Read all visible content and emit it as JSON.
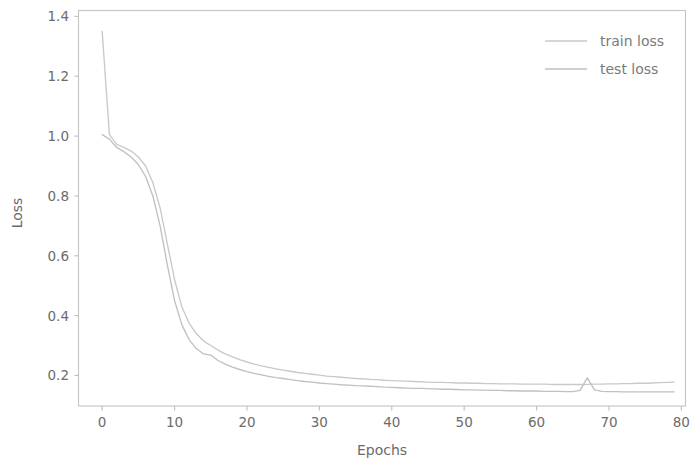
{
  "figure": {
    "background_color": "#ffffff",
    "axes_color": "#c4c4c4",
    "text_color": "#6b6b6b"
  },
  "axes": {
    "xlabel": "Epochs",
    "ylabel": "Loss",
    "x_ticks": [
      "0",
      "10",
      "20",
      "30",
      "40",
      "50",
      "60",
      "70",
      "80"
    ],
    "y_ticks": [
      "0.2",
      "0.4",
      "0.6",
      "0.8",
      "1.0",
      "1.2",
      "1.4"
    ]
  },
  "legend": {
    "items": [
      {
        "label": "train loss",
        "color": "#c9c9c9"
      },
      {
        "label": "test loss",
        "color": "#c0c0c0"
      }
    ]
  },
  "chart_data": {
    "type": "line",
    "title": "",
    "xlabel": "Epochs",
    "ylabel": "Loss",
    "xlim": [
      -3.2,
      80.5
    ],
    "ylim": [
      0.098,
      1.418
    ],
    "x_ticks": [
      0,
      10,
      20,
      30,
      40,
      50,
      60,
      70,
      80
    ],
    "y_ticks": [
      0.2,
      0.4,
      0.6,
      0.8,
      1.0,
      1.2,
      1.4
    ],
    "grid": false,
    "legend_position": "upper right",
    "x": [
      0,
      1,
      2,
      3,
      4,
      5,
      6,
      7,
      8,
      9,
      10,
      11,
      12,
      13,
      14,
      15,
      16,
      17,
      18,
      19,
      20,
      21,
      22,
      23,
      24,
      25,
      26,
      27,
      28,
      29,
      30,
      31,
      32,
      33,
      34,
      35,
      36,
      37,
      38,
      39,
      40,
      41,
      42,
      43,
      44,
      45,
      46,
      47,
      48,
      49,
      50,
      51,
      52,
      53,
      54,
      55,
      56,
      57,
      58,
      59,
      60,
      61,
      62,
      63,
      64,
      65,
      66,
      67,
      68,
      69,
      70,
      71,
      72,
      73,
      74,
      75,
      76,
      77,
      78,
      79
    ],
    "series": [
      {
        "name": "train loss",
        "color": "#c9c9c9",
        "values": [
          1.35,
          1.005,
          0.972,
          0.962,
          0.95,
          0.93,
          0.9,
          0.845,
          0.76,
          0.64,
          0.52,
          0.43,
          0.375,
          0.34,
          0.315,
          0.3,
          0.285,
          0.272,
          0.262,
          0.253,
          0.245,
          0.238,
          0.232,
          0.227,
          0.222,
          0.218,
          0.214,
          0.21,
          0.207,
          0.204,
          0.201,
          0.198,
          0.196,
          0.194,
          0.192,
          0.19,
          0.189,
          0.187,
          0.186,
          0.184,
          0.183,
          0.182,
          0.181,
          0.18,
          0.179,
          0.178,
          0.177,
          0.177,
          0.176,
          0.175,
          0.175,
          0.174,
          0.174,
          0.173,
          0.173,
          0.172,
          0.172,
          0.172,
          0.171,
          0.171,
          0.171,
          0.171,
          0.17,
          0.17,
          0.17,
          0.17,
          0.17,
          0.17,
          0.171,
          0.171,
          0.172,
          0.172,
          0.173,
          0.173,
          0.174,
          0.174,
          0.175,
          0.176,
          0.177,
          0.178
        ]
      },
      {
        "name": "test loss",
        "color": "#c0c0c0",
        "values": [
          1.005,
          0.99,
          0.962,
          0.948,
          0.93,
          0.905,
          0.865,
          0.8,
          0.7,
          0.57,
          0.45,
          0.37,
          0.32,
          0.29,
          0.272,
          0.268,
          0.25,
          0.238,
          0.228,
          0.22,
          0.213,
          0.207,
          0.202,
          0.197,
          0.193,
          0.19,
          0.186,
          0.183,
          0.18,
          0.178,
          0.175,
          0.173,
          0.171,
          0.169,
          0.168,
          0.166,
          0.165,
          0.164,
          0.163,
          0.161,
          0.16,
          0.159,
          0.158,
          0.157,
          0.157,
          0.156,
          0.155,
          0.154,
          0.154,
          0.153,
          0.152,
          0.152,
          0.151,
          0.151,
          0.15,
          0.15,
          0.149,
          0.149,
          0.148,
          0.148,
          0.148,
          0.147,
          0.147,
          0.147,
          0.146,
          0.146,
          0.15,
          0.192,
          0.152,
          0.147,
          0.146,
          0.146,
          0.145,
          0.145,
          0.145,
          0.145,
          0.145,
          0.145,
          0.145,
          0.145
        ]
      }
    ]
  }
}
